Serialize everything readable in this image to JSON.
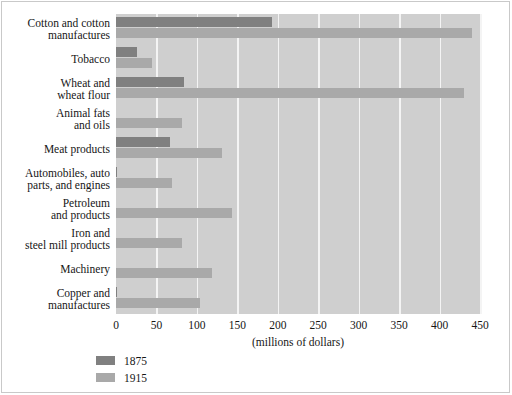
{
  "chart_data": {
    "type": "bar",
    "orientation": "horizontal",
    "title": "",
    "xlabel": "(millions of dollars)",
    "ylabel": "",
    "xlim": [
      0,
      450
    ],
    "xticks": [
      0,
      50,
      100,
      150,
      200,
      250,
      300,
      350,
      400,
      450
    ],
    "xtick_labels": [
      "0",
      "50",
      "100",
      "150",
      "200",
      "250",
      "300",
      "350",
      "400",
      "450"
    ],
    "grid": "vertical",
    "legend_position": "below-left",
    "categories": [
      "Cotton and cotton\nmanufactures",
      "Tobacco",
      "Wheat and\nwheat flour",
      "Animal fats\nand oils",
      "Meat products",
      "Automobiles, auto\nparts, and engines",
      "Petroleum\nand products",
      "Iron and\nsteel mill products",
      "Machinery",
      "Copper and\nmanufactures"
    ],
    "series": [
      {
        "name": "1875",
        "color": "#808080",
        "values": [
          193,
          26,
          84,
          0,
          67,
          1,
          0,
          0,
          0,
          1
        ]
      },
      {
        "name": "1915",
        "color": "#a9a9a9",
        "values": [
          440,
          44,
          430,
          82,
          131,
          69,
          143,
          81,
          119,
          104
        ]
      }
    ]
  },
  "legend": {
    "entries": [
      {
        "label": "1875",
        "color": "#808080"
      },
      {
        "label": "1915",
        "color": "#a9a9a9"
      }
    ]
  },
  "style": {
    "plot_background": "#cfcfcf",
    "gridline_color": "#f4f4f4",
    "frame_color": "#c9c9c9",
    "text_color": "#161616"
  }
}
